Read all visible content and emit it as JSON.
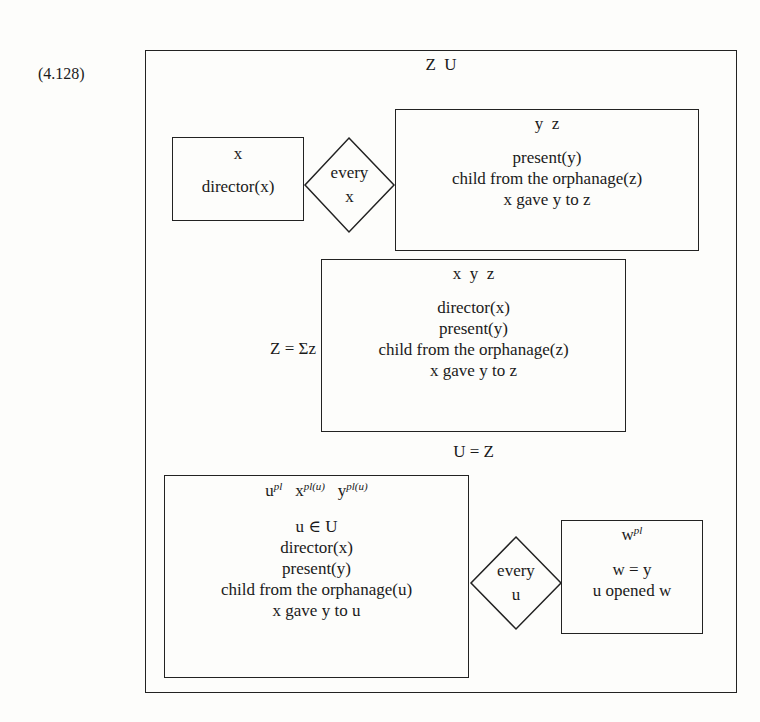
{
  "equation_number": "(4.128)",
  "outer_box": {
    "universe": "Z  U"
  },
  "top_condition": {
    "antecedent": {
      "universe": "x",
      "conditions": [
        "director(x)"
      ]
    },
    "quantifier": {
      "word": "every",
      "var": "x"
    },
    "consequent": {
      "universe": "y  z",
      "conditions": [
        "present(y)",
        "child from the orphanage(z)",
        "x gave y to z"
      ]
    }
  },
  "summation": {
    "label": "Z = Σz",
    "box": {
      "universe": "x  y  z",
      "conditions": [
        "director(x)",
        "present(y)",
        "child from the orphanage(z)",
        "x gave y to z"
      ]
    }
  },
  "equation": "U = Z",
  "bottom_condition": {
    "antecedent": {
      "universe": [
        {
          "base": "u",
          "sup": "pl"
        },
        {
          "base": "x",
          "sup": "pl(u)"
        },
        {
          "base": "y",
          "sup": "pl(u)"
        }
      ],
      "conditions": [
        "u ∈ U",
        "director(x)",
        "present(y)",
        "child from the orphanage(u)",
        "x gave y to u"
      ]
    },
    "quantifier": {
      "word": "every",
      "var": "u"
    },
    "consequent": {
      "universe": [
        {
          "base": "w",
          "sup": "pl"
        }
      ],
      "conditions": [
        "w = y",
        "u opened w"
      ]
    }
  }
}
